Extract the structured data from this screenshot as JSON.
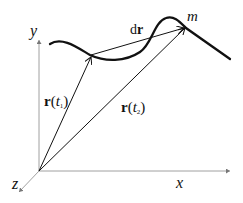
{
  "diagram": {
    "type": "position-vector-trajectory",
    "axes": {
      "x_label": "x",
      "y_label": "y",
      "z_label": "z"
    },
    "particle_label": "m",
    "vectors": [
      {
        "name": "r1",
        "bold": "r",
        "open": "(",
        "t": "t",
        "sub": "1",
        "close": ")"
      },
      {
        "name": "r2",
        "bold": "r",
        "open": "(",
        "t": "t",
        "sub": "2",
        "close": ")"
      },
      {
        "name": "dr",
        "prefix": "d",
        "bold": "r"
      }
    ],
    "colors": {
      "line": "#111111",
      "axis": "#888888",
      "background": "#ffffff"
    }
  }
}
